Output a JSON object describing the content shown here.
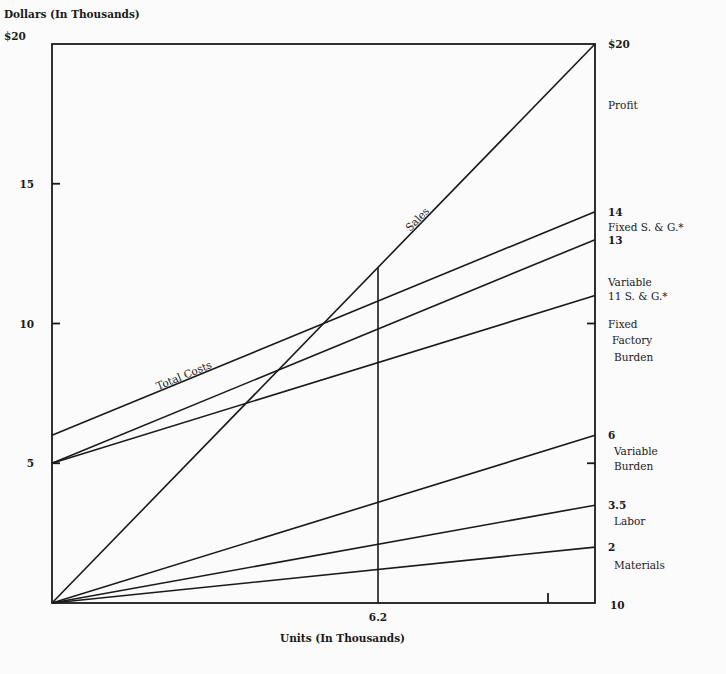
{
  "chart_data": {
    "type": "line",
    "ylabel": "Dollars (In Thousands)",
    "xlabel": "Units (In Thousands)",
    "ylim": [
      0,
      20
    ],
    "xlim": [
      0,
      10
    ],
    "left_ticks": [
      {
        "value": 20,
        "label": "$20"
      },
      {
        "value": 15,
        "label": "15"
      },
      {
        "value": 10,
        "label": "10"
      },
      {
        "value": 5,
        "label": "5"
      }
    ],
    "right_labels": [
      {
        "value": 20,
        "label": "$20"
      },
      {
        "value": 17.8,
        "label": "Profit"
      },
      {
        "value": 14,
        "label": "14"
      },
      {
        "value": 13.45,
        "label": "Fixed S. & G.*"
      },
      {
        "value": 13,
        "label": "13"
      },
      {
        "value": 11.5,
        "label": "Variable"
      },
      {
        "value": 11,
        "label": "11 S. & G.*"
      },
      {
        "value": 10,
        "label": "Fixed"
      },
      {
        "value": 9.4,
        "label": "Factory"
      },
      {
        "value": 8.8,
        "label": "Burden"
      },
      {
        "value": 6,
        "label": "6"
      },
      {
        "value": 5.45,
        "label": "Variable"
      },
      {
        "value": 4.9,
        "label": "Burden"
      },
      {
        "value": 3.5,
        "label": "3.5"
      },
      {
        "value": 2.95,
        "label": "Labor"
      },
      {
        "value": 2,
        "label": "2"
      },
      {
        "value": 1.35,
        "label": "Materials"
      },
      {
        "value": 0,
        "label": "10"
      }
    ],
    "x_marker": {
      "value": 6.2,
      "label": "6.2"
    },
    "series": [
      {
        "name": "Sales",
        "start": 0,
        "end": 20,
        "label": "Sales"
      },
      {
        "name": "Total Costs",
        "start": 6,
        "end": 14,
        "label": "Total Costs"
      },
      {
        "name": "Variable S. & G.",
        "start": 5,
        "end": 13
      },
      {
        "name": "Fixed Factory Burden line",
        "start": 5,
        "end": 11
      },
      {
        "name": "Variable Burden",
        "start": 0,
        "end": 6
      },
      {
        "name": "Labor",
        "start": 0,
        "end": 3.5
      },
      {
        "name": "Materials",
        "start": 0,
        "end": 2
      }
    ],
    "grid": false,
    "legend": "inline labels on right axis"
  },
  "labels": {
    "y_axis_title": "Dollars (In Thousands)",
    "x_axis_title": "Units (In Thousands)",
    "sales": "Sales",
    "total_costs": "Total Costs",
    "marker": "6.2"
  }
}
